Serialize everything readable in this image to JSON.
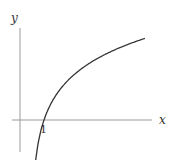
{
  "chart_data": {
    "type": "line",
    "title": "",
    "xlabel": "x",
    "ylabel": "y",
    "x_tick_labels": [
      "1"
    ],
    "series": [
      {
        "name": "y = ln(x)",
        "x": [
          0.3,
          0.5,
          1,
          2,
          3,
          4,
          5,
          6,
          7,
          8,
          9,
          10
        ],
        "values": [
          -1.204,
          -0.693,
          0,
          0.693,
          1.099,
          1.386,
          1.609,
          1.792,
          1.946,
          2.079,
          2.197,
          2.303
        ]
      }
    ],
    "grid": false,
    "legend": "none",
    "colors": {
      "curve": "#333333",
      "axes": "#999999"
    }
  }
}
